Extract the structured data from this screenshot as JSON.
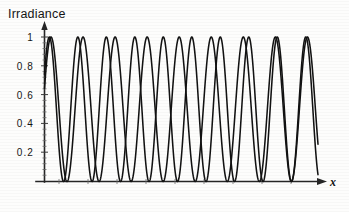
{
  "figure": {
    "title": "Irradiance",
    "x_axis_name": "x",
    "y_ticks": [
      "1",
      "0.8",
      "0.6",
      "0.4",
      "0.2"
    ],
    "arrow_y_name": "y-axis-arrow",
    "arrow_x_name": "x-axis-arrow"
  },
  "chart_data": {
    "type": "line",
    "title": "Irradiance",
    "xlabel": "x",
    "ylabel": "Irradiance",
    "xlim": [
      0,
      9.6
    ],
    "ylim": [
      0,
      1.05
    ],
    "grid": false,
    "legend": "none",
    "tick_labels": {
      "y": [
        "0.2",
        "0.4",
        "0.6",
        "0.8",
        "1"
      ],
      "y_values": [
        0.2,
        0.4,
        0.6,
        0.8,
        1.0
      ],
      "x": []
    },
    "series": [
      {
        "name": "curve-1",
        "function": "sin^2(pi*(x+0.33))",
        "period": 1.0,
        "phase": 0.33,
        "amplitude": 1.0,
        "n_maxima_visible": 9,
        "maxima_x": [
          0.17,
          1.17,
          2.17,
          3.17,
          4.17,
          5.17,
          6.17,
          7.17,
          8.17
        ],
        "minima_x": [
          0.67,
          1.67,
          2.67,
          3.67,
          4.67,
          5.67,
          6.67,
          7.67,
          8.67
        ],
        "y_at_x0": 0.56
      },
      {
        "name": "curve-2",
        "function": "sin^2(pi*(x/1.125 + 0.297))",
        "period": 1.125,
        "phase": 0.297,
        "amplitude": 1.0,
        "n_maxima_visible": 8,
        "maxima_x": [
          0.17,
          1.29,
          2.42,
          3.54,
          4.67,
          5.79,
          6.92,
          8.04
        ],
        "minima_x": [
          0.73,
          1.85,
          2.98,
          4.1,
          5.23,
          6.35,
          7.48,
          8.6
        ],
        "y_at_x0": 0.6
      }
    ],
    "coincidence_maxima_x": [
      0.17,
      3.17,
      6.17
    ],
    "coincidence_minima_x": [
      0.7,
      3.7,
      6.7
    ]
  }
}
